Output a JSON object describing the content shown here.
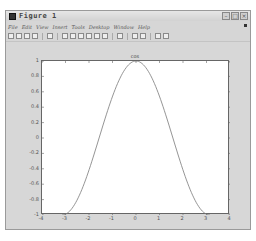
{
  "window": {
    "title": "Figure 1",
    "controls": [
      "minimize",
      "maximize",
      "close"
    ]
  },
  "menubar": {
    "items": [
      "File",
      "Edit",
      "View",
      "Insert",
      "Tools",
      "Desktop",
      "Window",
      "Help"
    ]
  },
  "toolbar": {
    "buttons": [
      "new-figure",
      "open-file",
      "save-figure",
      "print-figure",
      "edit-plot",
      "zoom-in",
      "zoom-out",
      "pan",
      "rotate-3d",
      "data-cursor",
      "brush",
      "link",
      "colorbar",
      "legend",
      "hide-plot-tools",
      "show-plot-tools"
    ]
  },
  "chart_data": {
    "type": "line",
    "title": "cos",
    "xlabel": "",
    "ylabel": "",
    "xlim": [
      -4,
      4
    ],
    "ylim": [
      -1,
      1
    ],
    "xticks": [
      "-4",
      "-3",
      "-2",
      "-1",
      "0",
      "1",
      "2",
      "3",
      "4"
    ],
    "yticks": [
      "1",
      "0.8",
      "0.6",
      "0.4",
      "0.2",
      "0",
      "-0.2",
      "-0.4",
      "-0.6",
      "-0.8",
      "-1"
    ],
    "grid": false,
    "series": [
      {
        "name": "cos(x)",
        "color": "#7a7a7a",
        "x": [
          -3.1416,
          -2.5,
          -2.0,
          -1.5,
          -1.0,
          -0.5,
          0,
          0.5,
          1.0,
          1.5,
          2.0,
          2.5,
          3.1416
        ],
        "y": [
          -1.0,
          -0.801,
          -0.416,
          0.071,
          0.54,
          0.878,
          1.0,
          0.878,
          0.54,
          0.071,
          -0.416,
          -0.801,
          -1.0
        ]
      }
    ]
  }
}
